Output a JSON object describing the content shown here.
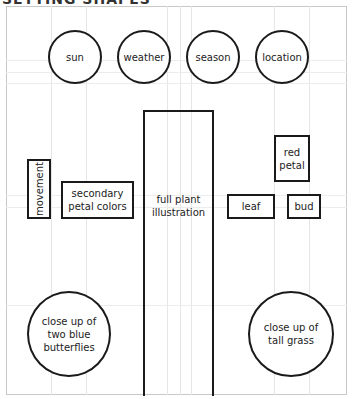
{
  "title": "SETTING SHAPES",
  "top_row": [
    {
      "label": "sun"
    },
    {
      "label": "weather"
    },
    {
      "label": "season"
    },
    {
      "label": "location"
    }
  ],
  "middle": {
    "movement": {
      "label": "movement"
    },
    "secondary_petal_colors": {
      "label": "secondary\npetal colors"
    },
    "full_plant": {
      "label": "full plant\nillustration"
    },
    "red_petal": {
      "label": "red\npetal"
    },
    "leaf": {
      "label": "leaf"
    },
    "bud": {
      "label": "bud"
    }
  },
  "bottom": {
    "butterflies": {
      "label": "close up of\ntwo blue\nbutterflies"
    },
    "grass": {
      "label": "close up of\ntall grass"
    }
  }
}
